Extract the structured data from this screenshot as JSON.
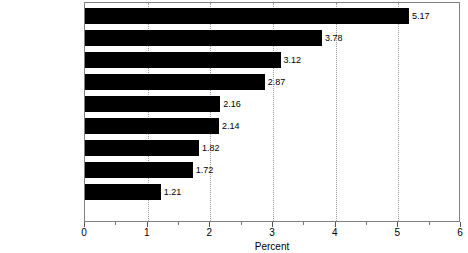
{
  "chart_data": {
    "type": "bar",
    "orientation": "horizontal",
    "title": "",
    "xlabel": "Percent",
    "ylabel": "",
    "categories": [
      "Japan",
      "Italy",
      "France",
      "West Germany",
      "Sweden",
      "United Kingdom",
      "Canada",
      "Australia",
      "United States"
    ],
    "values": [
      5.17,
      3.78,
      3.12,
      2.87,
      2.16,
      2.14,
      1.82,
      1.72,
      1.21
    ],
    "value_labels": [
      "5.17",
      "3.78",
      "3.12",
      "2.87",
      "2.16",
      "2.14",
      "1.82",
      "1.72",
      "1.21"
    ],
    "xlim": [
      0,
      6
    ],
    "xticks": [
      0,
      1,
      2,
      3,
      4,
      5,
      6
    ],
    "xtick_labels": [
      "0",
      "1",
      "2",
      "3",
      "4",
      "5",
      "6"
    ],
    "xminor_ticks": [
      0.5,
      1.5,
      2.5,
      3.5,
      4.5,
      5.5
    ],
    "gridlines": [
      1,
      2,
      3,
      4,
      5
    ],
    "grid": "vertical-dotted",
    "legend": "none",
    "bar_color": "#000000",
    "grid_color": "#9a9a9a",
    "frame_color": "#808080",
    "text_color": "#000000"
  }
}
